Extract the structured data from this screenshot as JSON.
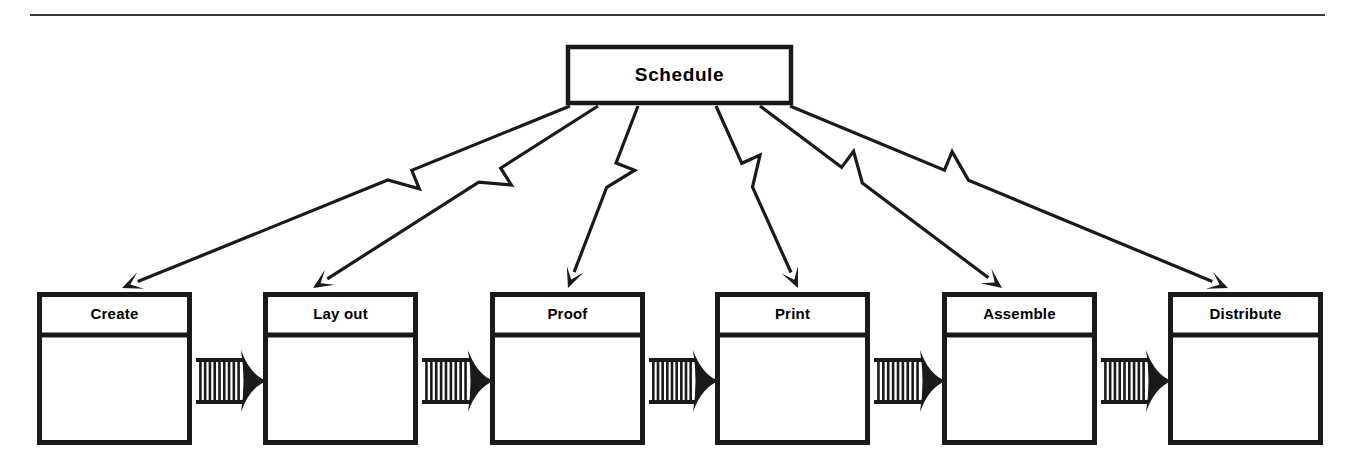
{
  "diagram": {
    "title_box": {
      "label": "Schedule",
      "x": 566,
      "y": 45,
      "width": 227,
      "height": 60
    },
    "divider": {
      "name": "top-horizontal-rule",
      "x1": 30,
      "y1": 15,
      "x2": 1325,
      "y2": 15
    },
    "colors": {
      "stroke": "#1a1a1a",
      "background": "#ffffff",
      "fill": "#ffffff"
    },
    "stages": [
      {
        "label": "Create",
        "x": 37,
        "y": 292,
        "width": 155,
        "height": 153,
        "header_height": 43
      },
      {
        "label": "Lay out",
        "x": 263,
        "y": 292,
        "width": 155,
        "height": 153,
        "header_height": 43
      },
      {
        "label": "Proof",
        "x": 490,
        "y": 292,
        "width": 155,
        "height": 153,
        "header_height": 43
      },
      {
        "label": "Print",
        "x": 715,
        "y": 292,
        "width": 155,
        "height": 153,
        "header_height": 43
      },
      {
        "label": "Assemble",
        "x": 942,
        "y": 292,
        "width": 155,
        "height": 153,
        "header_height": 43
      },
      {
        "label": "Distribute",
        "x": 1168,
        "y": 292,
        "width": 155,
        "height": 153,
        "header_height": 43
      }
    ],
    "connectors": [
      {
        "name": "connector-create-to-layout",
        "from": "Create",
        "to": "Lay out",
        "x": 196,
        "y": 358,
        "length": 63,
        "height": 46,
        "stripes": 9
      },
      {
        "name": "connector-layout-to-proof",
        "from": "Lay out",
        "to": "Proof",
        "x": 422,
        "y": 358,
        "length": 64,
        "height": 46,
        "stripes": 9
      },
      {
        "name": "connector-proof-to-print",
        "from": "Proof",
        "to": "Print",
        "x": 649,
        "y": 358,
        "length": 62,
        "height": 46,
        "stripes": 9
      },
      {
        "name": "connector-print-to-assemble",
        "from": "Print",
        "to": "Assemble",
        "x": 874,
        "y": 358,
        "length": 64,
        "height": 46,
        "stripes": 9
      },
      {
        "name": "connector-assemble-to-distribute",
        "from": "Assemble",
        "to": "Distribute",
        "x": 1101,
        "y": 358,
        "length": 63,
        "height": 46,
        "stripes": 9
      }
    ],
    "zigzag_arrows": [
      {
        "name": "zigzag-schedule-to-create",
        "from": "Schedule",
        "to": "Create",
        "start_x": 570,
        "start_y": 106,
        "end_x": 122,
        "end_y": 288
      },
      {
        "name": "zigzag-schedule-to-layout",
        "from": "Schedule",
        "to": "Lay out",
        "start_x": 598,
        "start_y": 106,
        "end_x": 313,
        "end_y": 288
      },
      {
        "name": "zigzag-schedule-to-proof",
        "from": "Schedule",
        "to": "Proof",
        "start_x": 638,
        "start_y": 106,
        "end_x": 568,
        "end_y": 288
      },
      {
        "name": "zigzag-schedule-to-print",
        "from": "Schedule",
        "to": "Print",
        "start_x": 716,
        "start_y": 106,
        "end_x": 798,
        "end_y": 288
      },
      {
        "name": "zigzag-schedule-to-assemble",
        "from": "Schedule",
        "to": "Assemble",
        "start_x": 760,
        "start_y": 106,
        "end_x": 1002,
        "end_y": 288
      },
      {
        "name": "zigzag-schedule-to-distribute",
        "from": "Schedule",
        "to": "Distribute",
        "start_x": 790,
        "start_y": 106,
        "end_x": 1228,
        "end_y": 288
      }
    ]
  }
}
